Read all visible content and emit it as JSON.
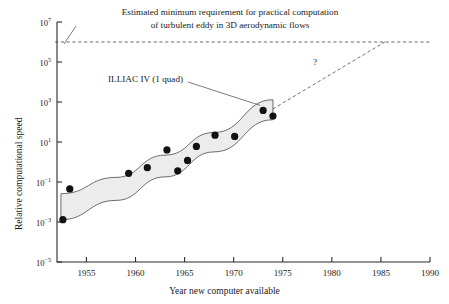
{
  "chart_data": {
    "type": "scatter",
    "title": "",
    "xlabel": "Year new computer available",
    "ylabel": "Relative computational speed",
    "xlim": [
      1952,
      1990
    ],
    "ylim_exponent": [
      -5,
      7
    ],
    "yscale": "log",
    "grid": false,
    "legend": "none",
    "xticks": [
      1955,
      1960,
      1965,
      1970,
      1975,
      1980,
      1985,
      1990
    ],
    "xtick_labels": [
      "1955",
      "1960",
      "1965",
      "1970",
      "1975",
      "1980",
      "1985",
      "1990"
    ],
    "ytick_exponents": [
      7,
      5,
      3,
      1,
      -1,
      -3,
      -5
    ],
    "ytick_labels": [
      "10⁷",
      "10⁵",
      "10³",
      "10¹",
      "10⁻¹",
      "10⁻³",
      "10⁻⁵"
    ],
    "ytick_mantissa": "10",
    "ytick_exponent_text": [
      "7",
      "5",
      "3",
      "1",
      "−1",
      "−3",
      "−5"
    ],
    "points": [
      {
        "year": 1952.6,
        "value": 0.0013
      },
      {
        "year": 1953.3,
        "value": 0.045
      },
      {
        "year": 1959.3,
        "value": 0.27
      },
      {
        "year": 1961.2,
        "value": 0.52
      },
      {
        "year": 1963.2,
        "value": 4.0
      },
      {
        "year": 1964.3,
        "value": 0.36
      },
      {
        "year": 1965.3,
        "value": 1.2
      },
      {
        "year": 1966.2,
        "value": 6.0
      },
      {
        "year": 1968.1,
        "value": 22.0
      },
      {
        "year": 1970.1,
        "value": 19.0
      },
      {
        "year": 1973.0,
        "value": 380.0
      },
      {
        "year": 1974.0,
        "value": 200.0
      }
    ],
    "band": {
      "label": "trend envelope",
      "fill_color": "#ececec",
      "edge_color": "#4a4a4a",
      "upper": [
        {
          "year": 1952.4,
          "value": 0.026
        },
        {
          "year": 1958.0,
          "value": 0.17
        },
        {
          "year": 1963.0,
          "value": 2.2
        },
        {
          "year": 1968.0,
          "value": 30.0
        },
        {
          "year": 1974.0,
          "value": 1300.0
        }
      ],
      "lower": [
        {
          "year": 1952.4,
          "value": 0.0013
        },
        {
          "year": 1958.0,
          "value": 0.012
        },
        {
          "year": 1963.0,
          "value": 0.18
        },
        {
          "year": 1968.0,
          "value": 3.2
        },
        {
          "year": 1974.0,
          "value": 130.0
        }
      ]
    },
    "requirement_line": {
      "value": 1000000.0,
      "value_exponent": 6,
      "style": "dashed",
      "x_start": 1952,
      "x_end": 1990
    },
    "projection_line": {
      "style": "dashed",
      "from": {
        "year": 1974.0,
        "value": 450.0
      },
      "to": {
        "year": 1985.4,
        "value": 1000000.0
      },
      "marker_label": "?"
    },
    "annotations": [
      {
        "name": "requirement-note",
        "line1": "Estimated minimum requirement for practical computation",
        "line2": "of turbulent eddy in 3D aerodynamic flows"
      },
      {
        "name": "illiac-note",
        "text": "ILLIAC IV (1 quad)"
      }
    ]
  },
  "axes": {
    "y_title": "Relative computational speed",
    "x_title": "Year new computer available"
  },
  "colors": {
    "ink": "#1a1a1a",
    "axis": "#2b2b2b",
    "band_fill": "#ececec",
    "band_edge": "#4a4a4a",
    "dashed": "#5a5a5a",
    "marker": "#111111",
    "background": "#ffffff"
  }
}
